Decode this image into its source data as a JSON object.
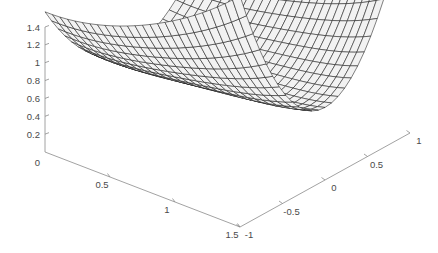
{
  "figure": {
    "title": "",
    "background_color": "#ffffff",
    "axis_color": "#8a8a8a",
    "tick_label_color": "#4a4a4a",
    "mesh_line_color": "#1a1a1a",
    "mesh_face_color": "#f2f2f2"
  },
  "chart_data": {
    "type": "surface",
    "title": "",
    "xlabel": "",
    "ylabel": "",
    "zlabel": "",
    "xlim": [
      0,
      1.5
    ],
    "ylim": [
      -1,
      1
    ],
    "zlim": [
      0,
      1.4
    ],
    "grid": false,
    "legend": "none",
    "projection": "3d-mesh",
    "view": {
      "azimuth": -37.5,
      "elevation": 30
    },
    "x_ticks": [
      0,
      0.5,
      1,
      1.5
    ],
    "x_tick_labels": [
      "0",
      "0.5",
      "1",
      "1.5"
    ],
    "y_ticks": [
      -1,
      -0.5,
      0,
      0.5,
      1
    ],
    "y_tick_labels": [
      "-1",
      "-0.5",
      "0",
      "0.5",
      "1"
    ],
    "z_ticks": [
      0.2,
      0.4,
      0.6,
      0.8,
      1,
      1.2,
      1.4
    ],
    "z_tick_labels": [
      "0.2",
      "0.4",
      "0.6",
      "0.8",
      "1",
      "1.2",
      "1.4"
    ],
    "x_range": [
      0.0,
      1.5
    ],
    "y_range": [
      -1.0,
      1.0
    ],
    "grid_nx": 26,
    "grid_ny": 26,
    "surface_description": "saddle-shaped valley surface, ridge rising on the near-left edge to about 1.45 and rising again at the far-right corner, with a curved trough running diagonally through the middle",
    "z_formula": "0.62 + 0.95*y*y - 0.80*x + 0.62*x*x + 0.55*x*y*y + 0.30*sin(2.1*x)*cos(1.2*y)",
    "z_min_approx": 0.0,
    "z_max_approx": 1.45,
    "sample_points": [
      {
        "x": 0.0,
        "y": -1.0,
        "z": 0.62
      },
      {
        "x": 0.0,
        "y": 0.0,
        "z": 0.62
      },
      {
        "x": 0.0,
        "y": 1.0,
        "z": 1.45
      },
      {
        "x": 0.75,
        "y": 0.0,
        "z": 0.38
      },
      {
        "x": 1.5,
        "y": -1.0,
        "z": 1.4
      },
      {
        "x": 1.5,
        "y": 1.0,
        "z": 1.38
      },
      {
        "x": 1.0,
        "y": 0.0,
        "z": 0.18
      }
    ]
  },
  "axes": {
    "x_axis": {
      "name": "x-axis",
      "ticks": [
        {
          "label": "0.5",
          "value": 0.5
        },
        {
          "label": "1",
          "value": 1
        },
        {
          "label": "1.5",
          "value": 1.5
        }
      ]
    },
    "y_axis": {
      "name": "y-axis",
      "ticks": [
        {
          "label": "-1",
          "value": -1
        },
        {
          "label": "-0.5",
          "value": -0.5
        },
        {
          "label": "0",
          "value": 0
        },
        {
          "label": "0.5",
          "value": 0.5
        },
        {
          "label": "1",
          "value": 1
        }
      ]
    },
    "z_axis": {
      "name": "z-axis",
      "origin_label": "0",
      "ticks": [
        {
          "label": "0.2",
          "value": 0.2
        },
        {
          "label": "0.4",
          "value": 0.4
        },
        {
          "label": "0.6",
          "value": 0.6
        },
        {
          "label": "0.8",
          "value": 0.8
        },
        {
          "label": "1",
          "value": 1
        },
        {
          "label": "1.2",
          "value": 1.2
        },
        {
          "label": "1.4",
          "value": 1.4
        }
      ]
    }
  }
}
